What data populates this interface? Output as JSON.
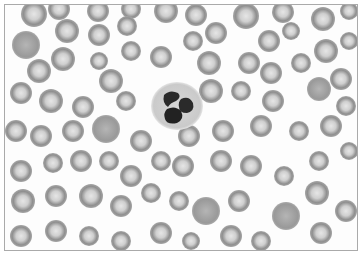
{
  "image": {
    "subject": "blood smear micrograph",
    "description": "Red blood cells surrounding a single segmented neutrophil",
    "colors": {
      "background": "#fdfdfd",
      "rbc_rim": "#8a8a8a",
      "rbc_center": "#d8d8d8",
      "nucleus": "#2a2a2a",
      "cytoplasm": "#d0d0d0",
      "border": "#aaaaaa"
    }
  }
}
